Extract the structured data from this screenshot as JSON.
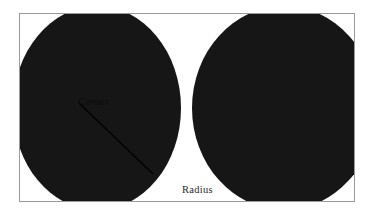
{
  "figure": {
    "frame": {
      "border_color": "#9b9b9b",
      "background_color": "#ffffff"
    },
    "shapes": [
      {
        "name": "left-circle",
        "fill": "#161616",
        "annotated": true
      },
      {
        "name": "right-circle",
        "fill": "#161616",
        "annotated": false
      }
    ],
    "annotations": {
      "center_label": "Center",
      "radius_label": "Radius"
    },
    "radius_line": {
      "color": "#000000",
      "from": "center",
      "to": "circumference"
    }
  }
}
